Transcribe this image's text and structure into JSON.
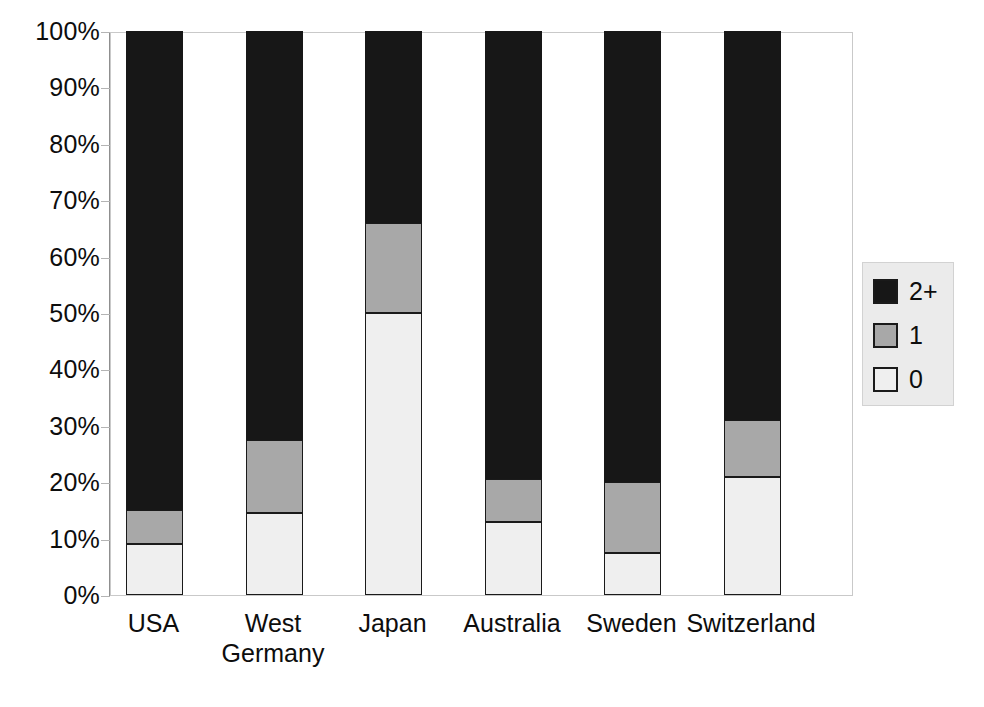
{
  "chart_data": {
    "type": "bar",
    "subtype": "stacked-100-percent",
    "title": "",
    "xlabel": "",
    "ylabel": "",
    "categories": [
      "USA",
      "West\nGermany",
      "Japan",
      "Australia",
      "Sweden",
      "Switzerland"
    ],
    "category_labels_flat": [
      "USA",
      "West Germany",
      "Japan",
      "Australia",
      "Sweden",
      "Switzerland"
    ],
    "series": [
      {
        "name": "0",
        "color": "#efefef",
        "values": [
          9,
          14.5,
          50,
          13,
          7.5,
          21
        ]
      },
      {
        "name": "1",
        "color": "#a8a8a8",
        "values": [
          6,
          13,
          16,
          7.5,
          12.5,
          10
        ]
      },
      {
        "name": "2+",
        "color": "#171717",
        "values": [
          85,
          72.5,
          34,
          79.5,
          80,
          69
        ]
      }
    ],
    "stack_order_bottom_to_top": [
      "0",
      "1",
      "2+"
    ],
    "ylim": [
      0,
      100
    ],
    "yticks": [
      0,
      10,
      20,
      30,
      40,
      50,
      60,
      70,
      80,
      90,
      100
    ],
    "ytick_labels": [
      "0%",
      "10%",
      "20%",
      "30%",
      "40%",
      "50%",
      "60%",
      "70%",
      "80%",
      "90%",
      "100%"
    ],
    "grid": false,
    "legend": {
      "position": "right",
      "entries": [
        {
          "label": "2+",
          "color": "#171717"
        },
        {
          "label": "1",
          "color": "#a8a8a8"
        },
        {
          "label": "0",
          "color": "#efefef"
        }
      ]
    }
  }
}
